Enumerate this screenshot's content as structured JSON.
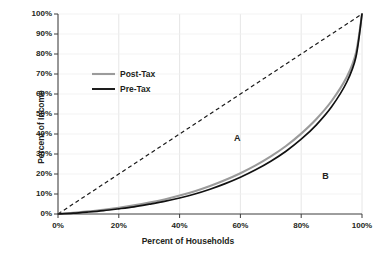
{
  "chart_data": {
    "type": "line",
    "title": "",
    "xlabel": "Percent of Households",
    "ylabel": "Percent of Income",
    "xlim": [
      0,
      100
    ],
    "ylim": [
      0,
      100
    ],
    "grid": true,
    "legend_position": "upper-left-inside",
    "x_ticks": [
      "0%",
      "20%",
      "40%",
      "60%",
      "80%",
      "100%"
    ],
    "x_tick_values": [
      0,
      20,
      40,
      60,
      80,
      100
    ],
    "y_ticks": [
      "0%",
      "10%",
      "20%",
      "30%",
      "40%",
      "50%",
      "60%",
      "70%",
      "80%",
      "90%",
      "100%"
    ],
    "y_tick_values": [
      0,
      10,
      20,
      30,
      40,
      50,
      60,
      70,
      80,
      90,
      100
    ],
    "x": [
      0,
      5,
      10,
      15,
      20,
      25,
      30,
      35,
      40,
      45,
      50,
      55,
      60,
      65,
      70,
      75,
      80,
      85,
      90,
      95,
      98,
      100
    ],
    "series": [
      {
        "name": "Line of Equality",
        "style": "dashed",
        "color": "#1a1a1a",
        "values": [
          0,
          5,
          10,
          15,
          20,
          25,
          30,
          35,
          40,
          45,
          50,
          55,
          60,
          65,
          70,
          75,
          80,
          85,
          90,
          95,
          98,
          100
        ]
      },
      {
        "name": "Post-Tax",
        "style": "solid",
        "color": "#9b9b9b",
        "values": [
          0,
          0.6,
          1.3,
          2.1,
          3.1,
          4.3,
          5.7,
          7.3,
          9.2,
          11.4,
          14.0,
          17.0,
          20.4,
          24.3,
          28.8,
          34.0,
          40.2,
          47.5,
          56.5,
          68.5,
          80.5,
          100
        ]
      },
      {
        "name": "Pre-Tax",
        "style": "solid",
        "color": "#111111",
        "values": [
          0,
          0.4,
          1.0,
          1.7,
          2.6,
          3.6,
          4.9,
          6.3,
          8.0,
          10.0,
          12.4,
          15.2,
          18.4,
          22.1,
          26.4,
          31.4,
          37.4,
          44.6,
          53.6,
          66.0,
          78.5,
          100
        ]
      }
    ],
    "annotations": [
      {
        "text": "A",
        "x": 59,
        "y": 38
      },
      {
        "text": "B",
        "x": 88,
        "y": 19
      }
    ],
    "legend_entries": [
      {
        "label": "Post-Tax",
        "color": "#9b9b9b"
      },
      {
        "label": "Pre-Tax",
        "color": "#111111"
      }
    ]
  }
}
